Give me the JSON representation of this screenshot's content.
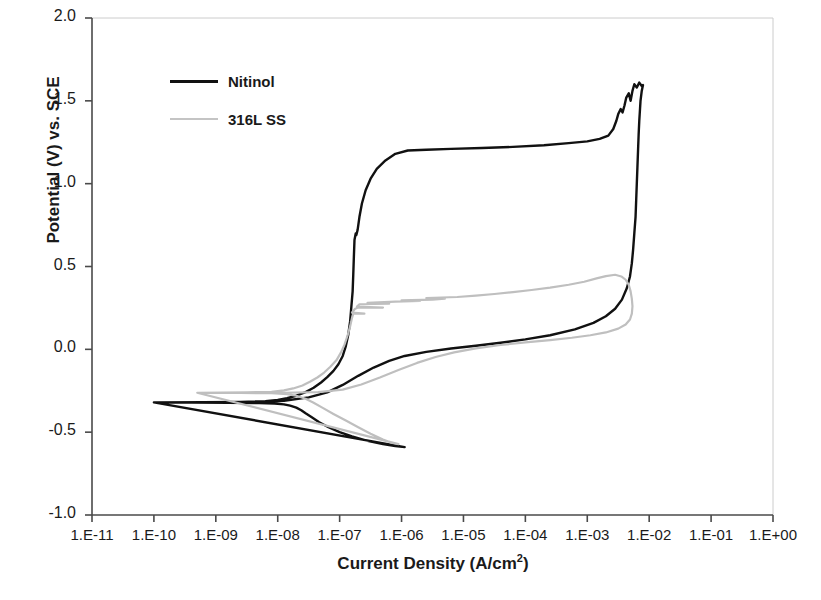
{
  "chart_data": {
    "type": "line",
    "title": "",
    "xlabel": "Current Density (A/cm2)",
    "xlabel_base": "Current Density (A/cm",
    "xlabel_sup": "2",
    "xlabel_tail": ")",
    "ylabel": "Potential (V) vs. SCE",
    "xscale": "log",
    "xlim": [
      -11,
      0
    ],
    "ylim": [
      -1.0,
      2.0
    ],
    "grid": false,
    "legend_position": "upper-left-inside",
    "xticklabels": [
      "1.E-11",
      "1.E-10",
      "1.E-09",
      "1.E-08",
      "1.E-07",
      "1.E-06",
      "1.E-05",
      "1.E-04",
      "1.E-03",
      "1.E-02",
      "1.E-01",
      "1.E+00"
    ],
    "xtickvalues": [
      -11,
      -10,
      -9,
      -8,
      -7,
      -6,
      -5,
      -4,
      -3,
      -2,
      -1,
      0
    ],
    "yticklabels": [
      "2.0",
      "1.5",
      "1.0",
      "0.5",
      "0.0",
      "-0.5",
      "-1.0"
    ],
    "ytickvalues": [
      2.0,
      1.5,
      1.0,
      0.5,
      0.0,
      -0.5,
      -1.0
    ],
    "colors": {
      "nitinol": "#111111",
      "ss316l": "#bfbfbf",
      "axis": "#555555"
    },
    "series": [
      {
        "name": "Nitinol",
        "color": "#111111",
        "points": [
          [
            -10.0,
            -0.32
          ],
          [
            -9.4,
            -0.321
          ],
          [
            -8.8,
            -0.322
          ],
          [
            -8.3,
            -0.324
          ],
          [
            -8.05,
            -0.327
          ],
          [
            -7.9,
            -0.332
          ],
          [
            -7.8,
            -0.34
          ],
          [
            -7.7,
            -0.352
          ],
          [
            -7.62,
            -0.368
          ],
          [
            -7.55,
            -0.386
          ],
          [
            -7.45,
            -0.41
          ],
          [
            -7.33,
            -0.44
          ],
          [
            -7.18,
            -0.47
          ],
          [
            -7.0,
            -0.5
          ],
          [
            -6.8,
            -0.525
          ],
          [
            -6.55,
            -0.552
          ],
          [
            -6.3,
            -0.572
          ],
          [
            -6.1,
            -0.584
          ],
          [
            -5.95,
            -0.59
          ],
          [
            -10.0,
            -0.32
          ],
          [
            -9.2,
            -0.319
          ],
          [
            -8.6,
            -0.317
          ],
          [
            -8.2,
            -0.313
          ],
          [
            -8.0,
            -0.306
          ],
          [
            -7.85,
            -0.295
          ],
          [
            -7.7,
            -0.28
          ],
          [
            -7.55,
            -0.258
          ],
          [
            -7.42,
            -0.232
          ],
          [
            -7.3,
            -0.2
          ],
          [
            -7.2,
            -0.168
          ],
          [
            -7.1,
            -0.13
          ],
          [
            -7.02,
            -0.09
          ],
          [
            -6.95,
            -0.04
          ],
          [
            -6.9,
            0.02
          ],
          [
            -6.86,
            0.09
          ],
          [
            -6.83,
            0.17
          ],
          [
            -6.81,
            0.26
          ],
          [
            -6.79,
            0.35
          ],
          [
            -6.78,
            0.45
          ],
          [
            -6.77,
            0.56
          ],
          [
            -6.76,
            0.66
          ],
          [
            -6.74,
            0.7
          ],
          [
            -6.73,
            0.69
          ],
          [
            -6.71,
            0.72
          ],
          [
            -6.68,
            0.8
          ],
          [
            -6.64,
            0.88
          ],
          [
            -6.58,
            0.96
          ],
          [
            -6.5,
            1.03
          ],
          [
            -6.4,
            1.09
          ],
          [
            -6.26,
            1.14
          ],
          [
            -6.1,
            1.18
          ],
          [
            -5.9,
            1.2
          ],
          [
            -5.6,
            1.205
          ],
          [
            -5.2,
            1.21
          ],
          [
            -4.7,
            1.215
          ],
          [
            -4.2,
            1.222
          ],
          [
            -3.7,
            1.232
          ],
          [
            -3.3,
            1.245
          ],
          [
            -3.0,
            1.255
          ],
          [
            -2.8,
            1.27
          ],
          [
            -2.66,
            1.29
          ],
          [
            -2.58,
            1.33
          ],
          [
            -2.53,
            1.38
          ],
          [
            -2.5,
            1.42
          ],
          [
            -2.46,
            1.45
          ],
          [
            -2.43,
            1.43
          ],
          [
            -2.4,
            1.47
          ],
          [
            -2.37,
            1.52
          ],
          [
            -2.33,
            1.545
          ],
          [
            -2.3,
            1.5
          ],
          [
            -2.27,
            1.56
          ],
          [
            -2.24,
            1.6
          ],
          [
            -2.2,
            1.58
          ],
          [
            -2.16,
            1.61
          ],
          [
            -2.12,
            1.59
          ],
          [
            -2.1,
            1.595
          ],
          [
            -2.12,
            1.56
          ],
          [
            -2.14,
            1.5
          ],
          [
            -2.15,
            1.44
          ],
          [
            -2.16,
            1.38
          ],
          [
            -2.17,
            1.3
          ],
          [
            -2.18,
            1.2
          ],
          [
            -2.19,
            1.1
          ],
          [
            -2.2,
            1.0
          ],
          [
            -2.21,
            0.9
          ],
          [
            -2.22,
            0.8
          ],
          [
            -2.24,
            0.7
          ],
          [
            -2.26,
            0.6
          ],
          [
            -2.28,
            0.52
          ],
          [
            -2.31,
            0.44
          ],
          [
            -2.36,
            0.37
          ],
          [
            -2.44,
            0.3
          ],
          [
            -2.55,
            0.245
          ],
          [
            -2.7,
            0.2
          ],
          [
            -2.9,
            0.16
          ],
          [
            -3.2,
            0.12
          ],
          [
            -3.6,
            0.085
          ],
          [
            -4.0,
            0.06
          ],
          [
            -4.4,
            0.04
          ],
          [
            -4.8,
            0.022
          ],
          [
            -5.2,
            0.005
          ],
          [
            -5.6,
            -0.015
          ],
          [
            -5.95,
            -0.04
          ],
          [
            -6.2,
            -0.07
          ],
          [
            -6.45,
            -0.11
          ],
          [
            -6.7,
            -0.16
          ],
          [
            -6.95,
            -0.215
          ],
          [
            -7.2,
            -0.26
          ],
          [
            -7.5,
            -0.29
          ],
          [
            -7.9,
            -0.31
          ],
          [
            -8.4,
            -0.32
          ]
        ]
      },
      {
        "name": "316L SS",
        "color": "#bfbfbf",
        "points": [
          [
            -9.3,
            -0.262
          ],
          [
            -8.6,
            -0.263
          ],
          [
            -8.1,
            -0.265
          ],
          [
            -7.85,
            -0.27
          ],
          [
            -7.7,
            -0.28
          ],
          [
            -7.55,
            -0.298
          ],
          [
            -7.42,
            -0.322
          ],
          [
            -7.28,
            -0.352
          ],
          [
            -7.1,
            -0.39
          ],
          [
            -6.9,
            -0.43
          ],
          [
            -6.7,
            -0.47
          ],
          [
            -6.5,
            -0.51
          ],
          [
            -6.3,
            -0.545
          ],
          [
            -6.15,
            -0.565
          ],
          [
            -6.05,
            -0.572
          ],
          [
            -9.3,
            -0.262
          ],
          [
            -8.5,
            -0.26
          ],
          [
            -8.1,
            -0.256
          ],
          [
            -7.9,
            -0.248
          ],
          [
            -7.75,
            -0.236
          ],
          [
            -7.6,
            -0.218
          ],
          [
            -7.48,
            -0.196
          ],
          [
            -7.36,
            -0.17
          ],
          [
            -7.25,
            -0.14
          ],
          [
            -7.15,
            -0.105
          ],
          [
            -7.05,
            -0.065
          ],
          [
            -6.98,
            -0.02
          ],
          [
            -6.92,
            0.03
          ],
          [
            -6.87,
            0.085
          ],
          [
            -6.83,
            0.14
          ],
          [
            -6.8,
            0.19
          ],
          [
            -6.78,
            0.215
          ],
          [
            -6.6,
            0.215
          ],
          [
            -6.8,
            0.222
          ],
          [
            -6.75,
            0.245
          ],
          [
            -6.7,
            0.252
          ],
          [
            -6.3,
            0.252
          ],
          [
            -6.72,
            0.258
          ],
          [
            -6.68,
            0.272
          ],
          [
            -6.2,
            0.276
          ],
          [
            -6.55,
            0.28
          ],
          [
            -6.1,
            0.288
          ],
          [
            -5.7,
            0.292
          ],
          [
            -6.0,
            0.296
          ],
          [
            -5.5,
            0.3
          ],
          [
            -5.3,
            0.306
          ],
          [
            -5.6,
            0.31
          ],
          [
            -5.1,
            0.316
          ],
          [
            -4.8,
            0.324
          ],
          [
            -4.5,
            0.334
          ],
          [
            -4.2,
            0.345
          ],
          [
            -3.9,
            0.358
          ],
          [
            -3.6,
            0.372
          ],
          [
            -3.3,
            0.39
          ],
          [
            -3.05,
            0.408
          ],
          [
            -2.85,
            0.428
          ],
          [
            -2.7,
            0.442
          ],
          [
            -2.55,
            0.45
          ],
          [
            -2.45,
            0.44
          ],
          [
            -2.38,
            0.42
          ],
          [
            -2.33,
            0.39
          ],
          [
            -2.3,
            0.35
          ],
          [
            -2.28,
            0.305
          ],
          [
            -2.27,
            0.26
          ],
          [
            -2.28,
            0.215
          ],
          [
            -2.31,
            0.18
          ],
          [
            -2.38,
            0.15
          ],
          [
            -2.5,
            0.125
          ],
          [
            -2.7,
            0.102
          ],
          [
            -2.95,
            0.085
          ],
          [
            -3.25,
            0.07
          ],
          [
            -3.6,
            0.056
          ],
          [
            -4.0,
            0.042
          ],
          [
            -4.4,
            0.026
          ],
          [
            -4.8,
            0.006
          ],
          [
            -5.15,
            -0.018
          ],
          [
            -5.45,
            -0.046
          ],
          [
            -5.75,
            -0.082
          ],
          [
            -6.05,
            -0.125
          ],
          [
            -6.35,
            -0.17
          ],
          [
            -6.65,
            -0.212
          ],
          [
            -6.95,
            -0.243
          ],
          [
            -7.35,
            -0.258
          ],
          [
            -7.9,
            -0.262
          ],
          [
            -8.6,
            -0.263
          ]
        ]
      }
    ]
  },
  "legend": {
    "items": [
      {
        "label": "Nitinol",
        "color": "#111111",
        "width": "3px"
      },
      {
        "label": "316L SS",
        "color": "#c4c4c4",
        "width": "2px"
      }
    ]
  },
  "caption": {
    "ghost_text": ""
  }
}
